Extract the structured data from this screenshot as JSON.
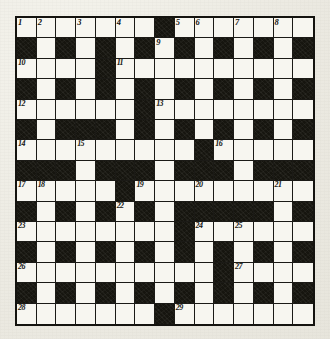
{
  "puzzle": {
    "title": "Crossword Grid",
    "type": "crossword",
    "rows": 15,
    "cols": 15,
    "colors": {
      "paper": "#efeee8",
      "white_cell": "#f7f6f0",
      "black_cell": "#16150f",
      "grid_line": "#1b1a16",
      "number_text": "#14130f"
    },
    "legend": {
      "black_symbol": "b",
      "white_symbol": "w"
    },
    "grid": [
      "wwwwwwwbwwwwwww",
      "bwbwbwbwbwbwbwb",
      "wwwwbwwwwwwwwww",
      "bwbwbwbwbwbwbwb",
      "wwwwwwbwwwwwwww",
      "bwbbbwbwbwbwbwb",
      "wwwwwwwwwbwwwww",
      "bbbwbbbwbbbwbbb",
      "wwwwwbwwwwwwwww",
      "bwbwbwbwbbbbbwb",
      "wwwwwwwwbwwwwww",
      "bwbwbwbwbwbwbwb",
      "wwwwwwwwwwbwwww",
      "bwbwbwbwbwbwbwb",
      "wwwwwwwbwwwwwww"
    ],
    "numbers": [
      {
        "n": "1",
        "row": 1,
        "col": 1
      },
      {
        "n": "2",
        "row": 1,
        "col": 2
      },
      {
        "n": "3",
        "row": 1,
        "col": 4
      },
      {
        "n": "4",
        "row": 1,
        "col": 6
      },
      {
        "n": "5",
        "row": 1,
        "col": 9
      },
      {
        "n": "6",
        "row": 1,
        "col": 10
      },
      {
        "n": "7",
        "row": 1,
        "col": 12
      },
      {
        "n": "8",
        "row": 1,
        "col": 14
      },
      {
        "n": "9",
        "row": 2,
        "col": 8
      },
      {
        "n": "10",
        "row": 3,
        "col": 1
      },
      {
        "n": "11",
        "row": 3,
        "col": 6
      },
      {
        "n": "12",
        "row": 5,
        "col": 1
      },
      {
        "n": "13",
        "row": 5,
        "col": 8
      },
      {
        "n": "14",
        "row": 7,
        "col": 1
      },
      {
        "n": "15",
        "row": 7,
        "col": 4
      },
      {
        "n": "16",
        "row": 7,
        "col": 11
      },
      {
        "n": "17",
        "row": 9,
        "col": 1
      },
      {
        "n": "18",
        "row": 9,
        "col": 2
      },
      {
        "n": "19",
        "row": 9,
        "col": 7
      },
      {
        "n": "20",
        "row": 9,
        "col": 10
      },
      {
        "n": "21",
        "row": 9,
        "col": 14
      },
      {
        "n": "22",
        "row": 10,
        "col": 6
      },
      {
        "n": "23",
        "row": 11,
        "col": 1
      },
      {
        "n": "24",
        "row": 11,
        "col": 10
      },
      {
        "n": "25",
        "row": 11,
        "col": 12
      },
      {
        "n": "26",
        "row": 13,
        "col": 1
      },
      {
        "n": "27",
        "row": 13,
        "col": 12
      },
      {
        "n": "28",
        "row": 15,
        "col": 1
      },
      {
        "n": "29",
        "row": 15,
        "col": 9
      }
    ]
  }
}
